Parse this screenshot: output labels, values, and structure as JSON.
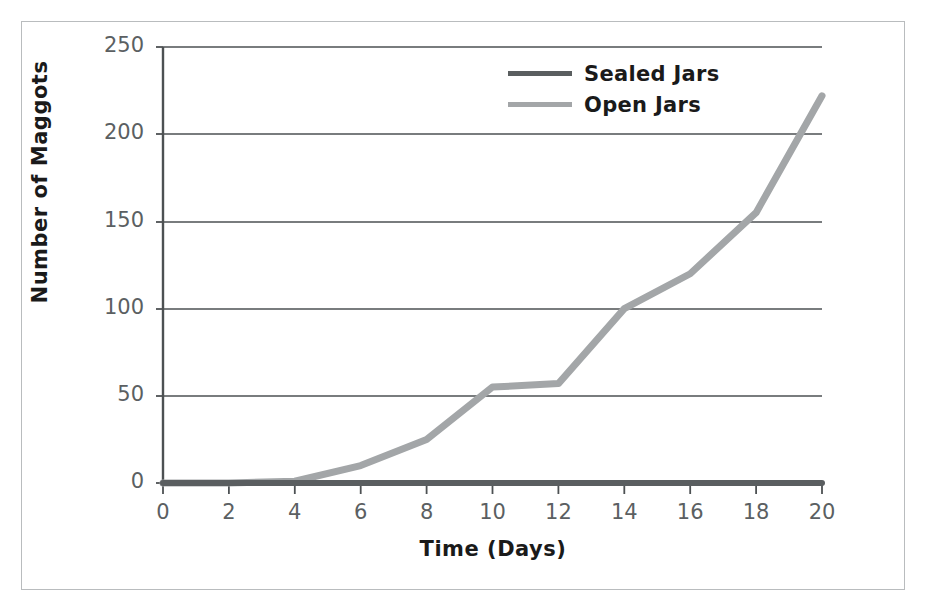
{
  "chart_data": {
    "type": "line",
    "title": "",
    "xlabel": "Time (Days)",
    "ylabel": "Number of Maggots",
    "xlim": [
      0,
      20
    ],
    "ylim": [
      0,
      250
    ],
    "xticks": [
      0,
      2,
      4,
      6,
      8,
      10,
      12,
      14,
      16,
      18,
      20
    ],
    "yticks": [
      0,
      50,
      100,
      150,
      200,
      250
    ],
    "grid": "horizontal",
    "legend_position": "top-center",
    "x": [
      0,
      2,
      4,
      6,
      8,
      10,
      12,
      14,
      16,
      18,
      20
    ],
    "series": [
      {
        "name": "Sealed Jars",
        "color": "#5a5e60",
        "values": [
          0,
          0,
          0,
          0,
          0,
          0,
          0,
          0,
          0,
          0,
          0
        ]
      },
      {
        "name": "Open Jars",
        "color": "#a3a6a8",
        "values": [
          0,
          0,
          1,
          10,
          25,
          55,
          57,
          100,
          120,
          155,
          222
        ]
      }
    ]
  },
  "axes": {
    "y_tick_labels": [
      "250",
      "200",
      "150",
      "100",
      "50",
      "0"
    ],
    "x_tick_labels": [
      "0",
      "2",
      "4",
      "6",
      "8",
      "10",
      "12",
      "14",
      "16",
      "18",
      "20"
    ],
    "y_axis_title": "Number of Maggots",
    "x_axis_title": "Time (Days)"
  },
  "legend": {
    "items": [
      {
        "label": "Sealed Jars",
        "color": "#5a5e60"
      },
      {
        "label": "Open Jars",
        "color": "#a3a6a8"
      }
    ]
  },
  "colors": {
    "sealed_jars": "#5a5e60",
    "open_jars": "#a3a6a8",
    "axis": "#4d5153",
    "gridline": "#4d5153",
    "frame": "#b9bcbe",
    "tick_text": "#5b5f62",
    "title_text": "#1a1a1a"
  }
}
